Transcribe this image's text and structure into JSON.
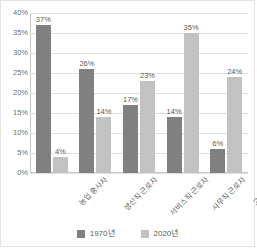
{
  "chart_data": {
    "type": "bar",
    "title": "",
    "subtitle": "",
    "xlabel": "",
    "ylabel": "",
    "ylim": [
      0,
      40
    ],
    "ytick_labels": [
      "40%",
      "35%",
      "30%",
      "25%",
      "20%",
      "15%",
      "10%",
      "5%",
      "0%"
    ],
    "ytick_values": [
      40,
      35,
      30,
      25,
      20,
      15,
      10,
      5,
      0
    ],
    "grid": true,
    "legend_position": "bottom",
    "categories": [
      "농업 종사자",
      "생산직 근로자",
      "서비스직 근로자",
      "사무직 근로자",
      "고급 기술자"
    ],
    "series": [
      {
        "name": "1970년",
        "color": "#808080",
        "values": [
          37,
          26,
          17,
          14,
          6
        ],
        "labels": [
          "37%",
          "26%",
          "17%",
          "14%",
          "6%"
        ]
      },
      {
        "name": "2020년",
        "color": "#c2c2c2",
        "values": [
          4,
          14,
          23,
          35,
          24
        ],
        "labels": [
          "4%",
          "14%",
          "23%",
          "35%",
          "24%"
        ]
      }
    ]
  },
  "legend": {
    "items": [
      {
        "label": "1970년",
        "color": "#808080"
      },
      {
        "label": "2020년",
        "color": "#c2c2c2"
      }
    ]
  }
}
